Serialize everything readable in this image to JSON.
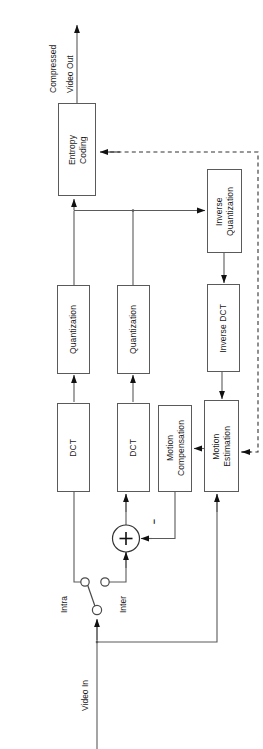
{
  "diagram": {
    "orientation": "rotated-90-ccw",
    "stroke_color": "#5a5a5a",
    "text_color": "#1a1a1a",
    "background": "#ffffff",
    "blocks": [
      {
        "id": "entropy_coding",
        "label": "Entropy\nCoding"
      },
      {
        "id": "inverse_quantization",
        "label": "Inverse\nQuantization"
      },
      {
        "id": "quantization_intra",
        "label": "Quantization"
      },
      {
        "id": "quantization_inter",
        "label": "Quantization"
      },
      {
        "id": "inverse_dct",
        "label": "Inverse DCT"
      },
      {
        "id": "dct_intra",
        "label": "DCT"
      },
      {
        "id": "dct_inter",
        "label": "DCT"
      },
      {
        "id": "motion_compensation",
        "label": "Motion\nCompensation"
      },
      {
        "id": "motion_estimation",
        "label": "Motion\nEstimation"
      }
    ],
    "labels": {
      "output": "Compressed",
      "output2": "Video Out",
      "input": "Video In",
      "switch_intra": "Intra",
      "switch_inter": "Inter",
      "adder_sign": "−",
      "adder_plus": "+"
    }
  }
}
